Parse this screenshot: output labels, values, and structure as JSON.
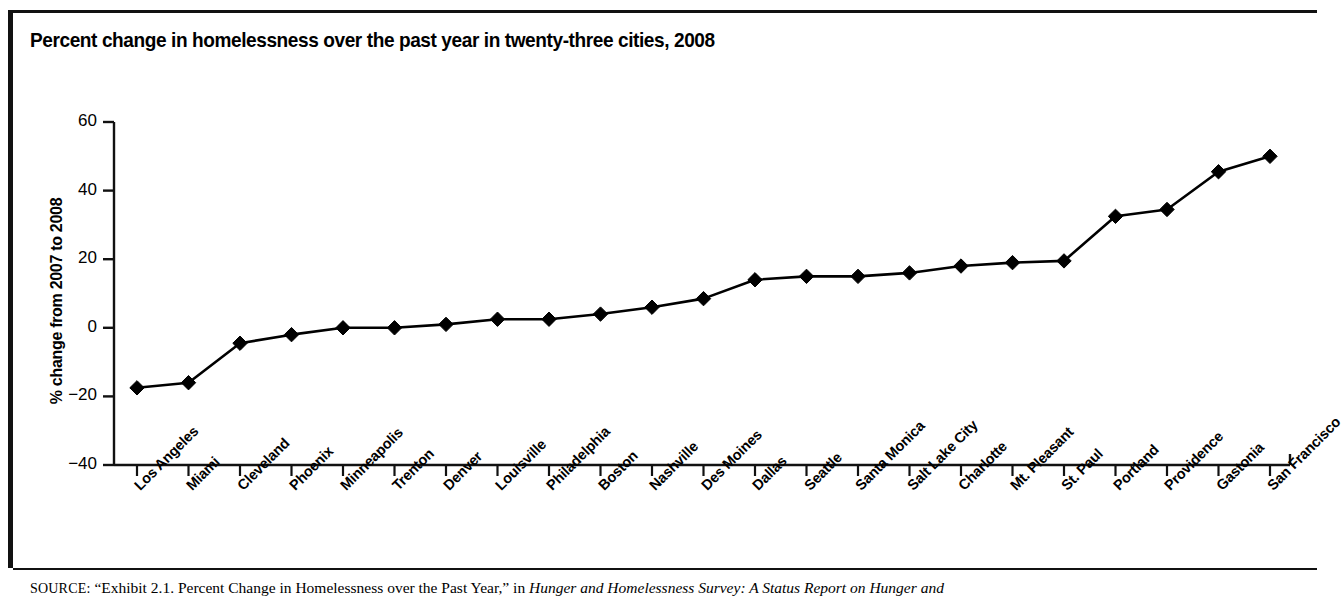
{
  "figure": {
    "title": "Percent change in homelessness over the past year in twenty-three cities, 2008",
    "source": {
      "label": "SOURCE:",
      "quoted_exhibit": "“Exhibit 2.1. Percent Change in Homelessness over the Past Year,”",
      "connector": "in",
      "publication_italic": "Hunger and Homelessness Survey: A Status Report on Hunger and"
    }
  },
  "chart_data": {
    "type": "line",
    "title": "Percent change in homelessness over the past year in twenty-three cities, 2008",
    "xlabel": "",
    "ylabel": "% change from 2007 to 2008",
    "ylim": [
      -40,
      60
    ],
    "yticks": [
      60,
      40,
      20,
      0,
      -20,
      -40
    ],
    "ytick_labels": [
      "60",
      "40",
      "20",
      "0",
      "−20",
      "−40"
    ],
    "grid": false,
    "legend": false,
    "marker": "diamond",
    "line_color": "#000000",
    "marker_color": "#000000",
    "categories": [
      "Los Angeles",
      "Miami",
      "Cleveland",
      "Phoenix",
      "Minneapolis",
      "Trenton",
      "Denver",
      "Louisville",
      "Philadelphia",
      "Boston",
      "Nashville",
      "Des Moines",
      "Dallas",
      "Seattle",
      "Santa Monica",
      "Salt Lake City",
      "Charlotte",
      "Mt. Pleasant",
      "St. Paul",
      "Portland",
      "Providence",
      "Gastonia",
      "San Francisco"
    ],
    "values": [
      -17.5,
      -16,
      -4.5,
      -2,
      0,
      0,
      1,
      2.5,
      2.5,
      4,
      6,
      8.5,
      14,
      15,
      15,
      16,
      18,
      19,
      19.5,
      32.5,
      34.5,
      45.5,
      50
    ]
  }
}
